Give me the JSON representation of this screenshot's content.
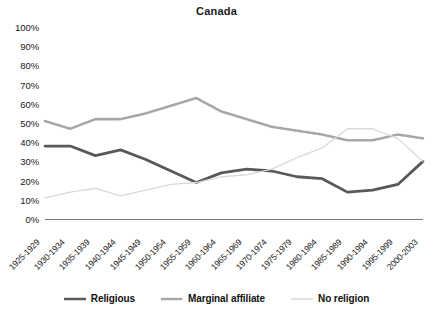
{
  "chart_data": {
    "type": "line",
    "title": "Canada",
    "xlabel": "",
    "ylabel": "",
    "ylim": [
      0,
      100
    ],
    "ytick_labels": [
      "100%",
      "90%",
      "80%",
      "70%",
      "60%",
      "50%",
      "40%",
      "30%",
      "20%",
      "10%",
      "0%"
    ],
    "ytick_values": [
      100,
      90,
      80,
      70,
      60,
      50,
      40,
      30,
      20,
      10,
      0
    ],
    "grid": false,
    "legend_position": "bottom",
    "categories": [
      "1925-1929",
      "1930-1934",
      "1935-1939",
      "1940-1944",
      "1945-1949",
      "1950-1954",
      "1955-1959",
      "1960-1964",
      "1965-1969",
      "1970-1974",
      "1975-1979",
      "1980-1984",
      "1985-1989",
      "1990-1994",
      "1995-1999",
      "2000-2003"
    ],
    "series": [
      {
        "name": "Religious",
        "style": "solid",
        "color": "#595959",
        "values": [
          38,
          38,
          33,
          36,
          31,
          25,
          19,
          24,
          26,
          25,
          22,
          21,
          14,
          15,
          18,
          30
        ]
      },
      {
        "name": "Marginal affiliate",
        "style": "dotted",
        "color": "#a6a6a6",
        "values": [
          51,
          47,
          52,
          52,
          55,
          59,
          63,
          56,
          52,
          48,
          46,
          44,
          41,
          41,
          44,
          42
        ]
      },
      {
        "name": "No religion",
        "style": "solid-light",
        "color": "#d9d9d9",
        "values": [
          11,
          14,
          16,
          12,
          15,
          18,
          19,
          22,
          23,
          26,
          32,
          37,
          47,
          47,
          42,
          30
        ]
      }
    ]
  },
  "axis": {
    "line_color": "#7a7a7a"
  },
  "legend": {
    "items": [
      {
        "label": "Religious",
        "swatch": "line-solid-dark"
      },
      {
        "label": "Marginal affiliate",
        "swatch": "line-dotted-gray"
      },
      {
        "label": "No religion",
        "swatch": "line-solid-light"
      }
    ]
  }
}
